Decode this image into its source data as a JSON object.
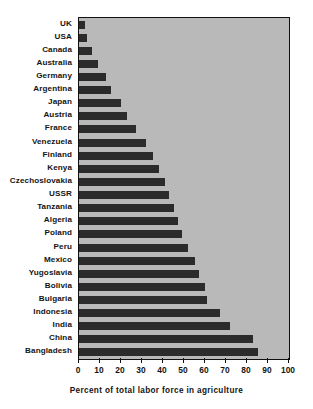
{
  "chart_data": {
    "type": "bar",
    "orientation": "horizontal",
    "title": "",
    "subtitle": "",
    "xlabel": "Percent of total labor force in agriculture",
    "ylabel": "",
    "xlim": [
      0,
      100
    ],
    "xticks": [
      0,
      10,
      20,
      30,
      40,
      50,
      60,
      70,
      80,
      90,
      100
    ],
    "xtick_labels": [
      "0",
      "10",
      "20",
      "30",
      "40",
      "50",
      "60",
      "70",
      "80",
      "90",
      "100"
    ],
    "grid": false,
    "legend": null,
    "sort_order": "ascending",
    "categories": [
      "UK",
      "USA",
      "Canada",
      "Australia",
      "Germany",
      "Argentina",
      "Japan",
      "Austria",
      "France",
      "Venezuela",
      "Finland",
      "Kenya",
      "Czechoslovakia",
      "USSR",
      "Tanzania",
      "Algeria",
      "Poland",
      "Peru",
      "Mexico",
      "Yugoslavia",
      "Bolivia",
      "Bulgaria",
      "Indonesia",
      "India",
      "China",
      "Bangladesh"
    ],
    "values": [
      3,
      4,
      6,
      9,
      13,
      15,
      20,
      23,
      27,
      32,
      35,
      38,
      41,
      43,
      45,
      47,
      49,
      52,
      55,
      57,
      60,
      61,
      67,
      72,
      83,
      85
    ],
    "bar_color": "#2b2b2b",
    "plot_background": "#b9b9b9",
    "page_background": "#ffffff",
    "axis_color": "#111111"
  }
}
